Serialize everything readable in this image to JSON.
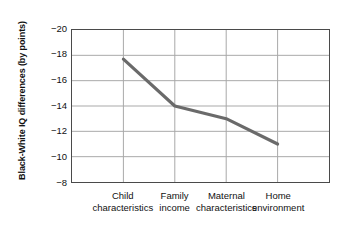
{
  "chart_data": {
    "type": "line",
    "title": "",
    "xlabel": "",
    "ylabel": "Black-White IQ differences (by points)",
    "categories": [
      "Child characteristics",
      "Family income",
      "Maternal characteristics",
      "Home environment"
    ],
    "category_lines": [
      [
        "Child",
        "characteristics"
      ],
      [
        "Family",
        "income"
      ],
      [
        "Maternal",
        "characteristics"
      ],
      [
        "Home",
        "environment"
      ]
    ],
    "values": [
      -17.7,
      -14.0,
      -13.0,
      -11.0
    ],
    "ylim": [
      -20,
      -8
    ],
    "yticks": [
      -20,
      -18,
      -16,
      -14,
      -12,
      -10,
      -8
    ],
    "ytick_labels": [
      "−20",
      "−18",
      "−16",
      "−14",
      "−12",
      "−10",
      "−8"
    ],
    "grid": true,
    "grid_axis": "both",
    "legend": "none",
    "markers": false,
    "series": [
      {
        "name": "Black-White IQ difference",
        "values": [
          -17.7,
          -14.0,
          -13.0,
          -11.0
        ]
      }
    ]
  },
  "style": {
    "line_color": "#6b6b6b",
    "grid_color": "#a8a8a8",
    "frame_color": "#4a4a4a",
    "text_color": "#111111",
    "background": "#ffffff",
    "line_width": 3.2
  }
}
